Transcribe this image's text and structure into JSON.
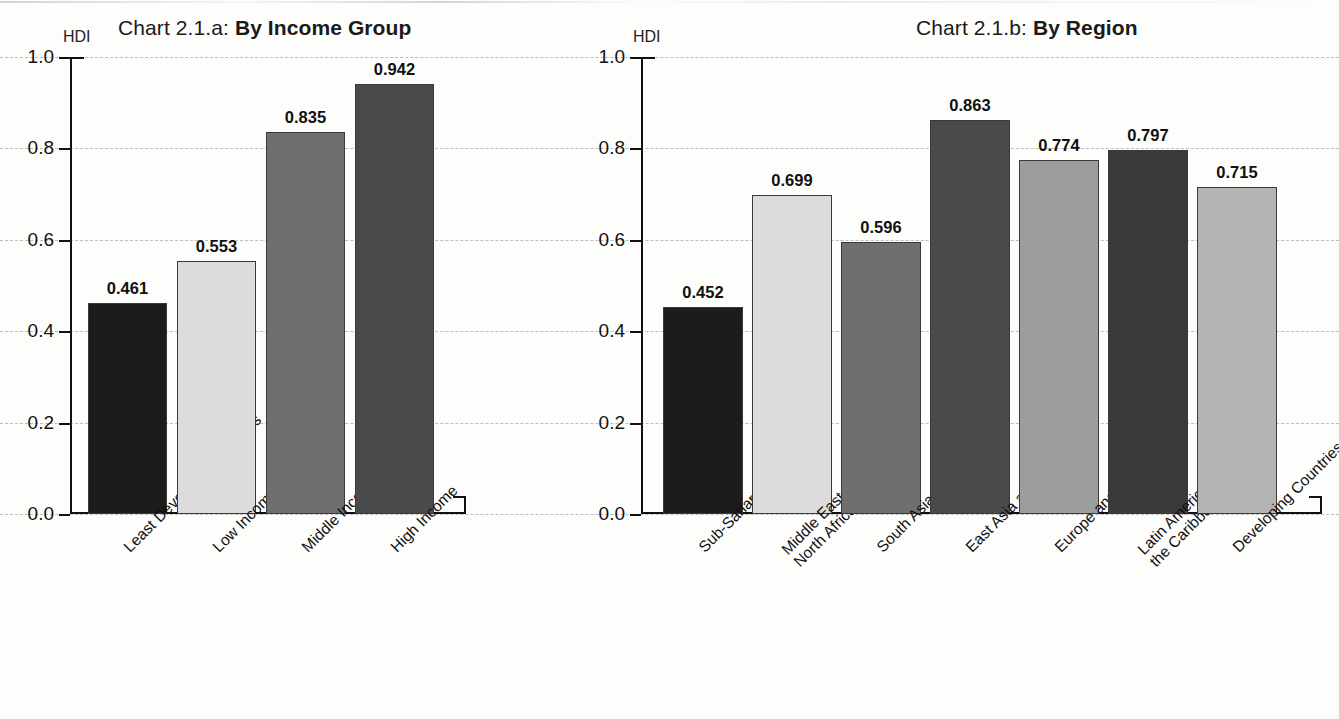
{
  "charts": [
    {
      "id": "chart-2-1-a",
      "title_prefix": "Chart 2.1.a:",
      "title_main": "By Income Group",
      "axis_unit": "HDI",
      "yticks": [
        "0.0",
        "0.2",
        "0.4",
        "0.6",
        "0.8",
        "1.0"
      ],
      "bars": [
        {
          "label": "Least Developed Countries",
          "value": "0.461",
          "color": "#1c1c1c"
        },
        {
          "label": "Low Income",
          "value": "0.553",
          "color": "#dcdcdc"
        },
        {
          "label": "Middle Income",
          "value": "0.835",
          "color": "#6f6f6f"
        },
        {
          "label": "High Income",
          "value": "0.942",
          "color": "#4a4a4a"
        }
      ]
    },
    {
      "id": "chart-2-1-b",
      "title_prefix": "Chart 2.1.b:",
      "title_main": "By Region",
      "axis_unit": "HDI",
      "yticks": [
        "0.0",
        "0.2",
        "0.4",
        "0.6",
        "0.8",
        "1.0"
      ],
      "bars": [
        {
          "label": "Sub-Saharan Africa",
          "value": "0.452",
          "color": "#1c1c1c"
        },
        {
          "label": "Middle East and\nNorth Africa",
          "value": "0.699",
          "color": "#dcdcdc"
        },
        {
          "label": "South Asia",
          "value": "0.596",
          "color": "#6f6f6f"
        },
        {
          "label": "East Asia and the Pacific",
          "value": "0.863",
          "color": "#4a4a4a"
        },
        {
          "label": "Europe and Central Asia",
          "value": "0.774",
          "color": "#9d9d9d"
        },
        {
          "label": "Latin America and\nthe Caribbean",
          "value": "0.797",
          "color": "#3a3a3a"
        },
        {
          "label": "Developing Countries",
          "value": "0.715",
          "color": "#b4b4b4"
        }
      ]
    }
  ],
  "chart_data": [
    {
      "type": "bar",
      "title": "Chart 2.1.a: By Income Group",
      "xlabel": "",
      "ylabel": "HDI",
      "ylim": [
        0.0,
        1.0
      ],
      "ytick_values": [
        0.0,
        0.2,
        0.4,
        0.6,
        0.8,
        1.0
      ],
      "grid": true,
      "legend": "none",
      "categories": [
        "Least Developed Countries",
        "Low Income",
        "Middle Income",
        "High Income"
      ],
      "values": [
        0.461,
        0.553,
        0.835,
        0.942
      ],
      "data_labels": [
        "0.461",
        "0.553",
        "0.835",
        "0.942"
      ],
      "bar_colors": [
        "#1c1c1c",
        "#dcdcdc",
        "#6f6f6f",
        "#4a4a4a"
      ]
    },
    {
      "type": "bar",
      "title": "Chart 2.1.b: By Region",
      "xlabel": "",
      "ylabel": "HDI",
      "ylim": [
        0.0,
        1.0
      ],
      "ytick_values": [
        0.0,
        0.2,
        0.4,
        0.6,
        0.8,
        1.0
      ],
      "grid": true,
      "legend": "none",
      "categories": [
        "Sub-Saharan Africa",
        "Middle East and North Africa",
        "South Asia",
        "East Asia and the Pacific",
        "Europe and Central Asia",
        "Latin America and the Caribbean",
        "Developing Countries"
      ],
      "values": [
        0.452,
        0.699,
        0.596,
        0.863,
        0.774,
        0.797,
        0.715
      ],
      "data_labels": [
        "0.452",
        "0.699",
        "0.596",
        "0.863",
        "0.774",
        "0.797",
        "0.715"
      ],
      "bar_colors": [
        "#1c1c1c",
        "#dcdcdc",
        "#6f6f6f",
        "#4a4a4a",
        "#9d9d9d",
        "#3a3a3a",
        "#b4b4b4"
      ]
    }
  ]
}
